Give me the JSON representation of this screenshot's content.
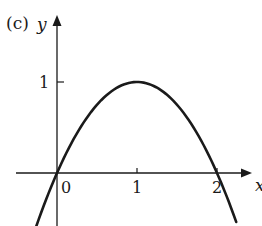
{
  "panel_label": "(c)",
  "colors": {
    "ink": "#1a1a1a",
    "background": "#ffffff"
  },
  "chart_data": {
    "type": "line",
    "title": "",
    "panel": "(c)",
    "xlabel": "x",
    "ylabel": "y",
    "function": "y = 2x - x^2",
    "x_ticks": [
      {
        "value": 0,
        "label": "0"
      },
      {
        "value": 1,
        "label": "1"
      },
      {
        "value": 2,
        "label": "2"
      }
    ],
    "y_ticks": [
      {
        "value": 1,
        "label": "1"
      }
    ],
    "xlim": [
      -0.5,
      2.45
    ],
    "ylim": [
      -0.6,
      1.75
    ],
    "grid": false,
    "legend": null,
    "series": [
      {
        "name": "curve",
        "x": [
          -0.26,
          0,
          0.25,
          0.5,
          0.75,
          1,
          1.25,
          1.5,
          1.75,
          2,
          2.24
        ],
        "y": [
          -0.59,
          0,
          0.44,
          0.75,
          0.94,
          1,
          0.94,
          0.75,
          0.44,
          0,
          -0.54
        ]
      }
    ],
    "key_points": [
      {
        "label": "root",
        "x": 0,
        "y": 0
      },
      {
        "label": "maximum",
        "x": 1,
        "y": 1
      },
      {
        "label": "root",
        "x": 2,
        "y": 0
      }
    ]
  },
  "layout": {
    "origin_px": [
      57,
      173
    ],
    "x_unit_px": 80,
    "y_unit_px": 91,
    "x_axis_px": [
      16,
      252
    ],
    "y_axis_px": [
      226,
      15
    ]
  }
}
